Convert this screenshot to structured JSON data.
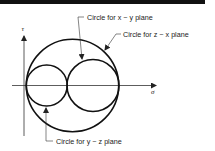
{
  "figure": {
    "type": "mohr-circles",
    "axes": {
      "horizontal_label": "σ",
      "vertical_label": "τ"
    },
    "circles": [
      {
        "name": "z-x",
        "label": "Circle for z − x plane",
        "cx": 72.5,
        "cy": 85.5,
        "r": 46
      },
      {
        "name": "x-y",
        "label": "Circle for x − y plane",
        "cx": 93,
        "cy": 85.5,
        "r": 26
      },
      {
        "name": "y-z",
        "label": "Circle for y − z plane",
        "cx": 46.5,
        "cy": 85.5,
        "r": 20.5
      }
    ],
    "annotations": {
      "xy": "Circle for x − y plane",
      "zx": "Circle for z − x plane",
      "yz": "Circle for y − z plane"
    },
    "colors": {
      "stroke": "#111111",
      "axis": "#333333",
      "text": "#222222"
    }
  }
}
